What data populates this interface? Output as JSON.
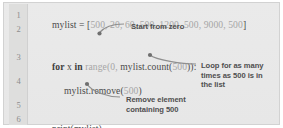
{
  "panel": {
    "background_color": "#e9e9e9",
    "border_color": "#d2d2d2",
    "gutter_color": "#dededd"
  },
  "code": {
    "language": "python",
    "line_numbers": [
      "1",
      "2",
      "3",
      "4",
      "5",
      "6"
    ],
    "lines": [
      {
        "number": "1",
        "text": "mylist = [500, 20, 60, 500, 1200, 500, 9000, 500]",
        "segments": [
          {
            "text": "mylist = [",
            "style": "plain"
          },
          {
            "text": "500, 20, 60, 500, 1200, 500, 9000, 500",
            "style": "dim"
          },
          {
            "text": "]",
            "style": "plain"
          }
        ]
      },
      {
        "number": "2",
        "text": "",
        "segments": []
      },
      {
        "number": "3",
        "text": "for x in range(0, mylist.count(500)):",
        "segments": [
          {
            "text": "for",
            "style": "keyword"
          },
          {
            "text": " x ",
            "style": "plain"
          },
          {
            "text": "in",
            "style": "keyword"
          },
          {
            "text": " ",
            "style": "plain"
          },
          {
            "text": "range(0,",
            "style": "dim"
          },
          {
            "text": " mylist.count(",
            "style": "plain"
          },
          {
            "text": "500",
            "style": "dim"
          },
          {
            "text": ")):",
            "style": "plain"
          }
        ]
      },
      {
        "number": "4",
        "text": "    mylist.remove(500)",
        "segments": [
          {
            "text": "mylist.remove(",
            "style": "plain"
          },
          {
            "text": "500",
            "style": "dim"
          },
          {
            "text": ")",
            "style": "plain"
          }
        ]
      },
      {
        "number": "5",
        "text": "",
        "segments": []
      },
      {
        "number": "6",
        "text": "print(mylist)",
        "segments": [
          {
            "text": "print(mylist)",
            "style": "plain"
          }
        ]
      }
    ]
  },
  "annotations": [
    {
      "id": "start-from-zero",
      "text": "Start from zero",
      "target": "range(0,",
      "color": "#4f4f4f"
    },
    {
      "id": "loop-count",
      "text": "Loop for as many\ntimes as 500 is in\nthe list",
      "target": "mylist.count(500)",
      "color": "#4f4f4f"
    },
    {
      "id": "remove-element",
      "text": "Remove element\ncontaining 500",
      "target": "mylist.remove(500)",
      "color": "#4f4f4f"
    }
  ]
}
